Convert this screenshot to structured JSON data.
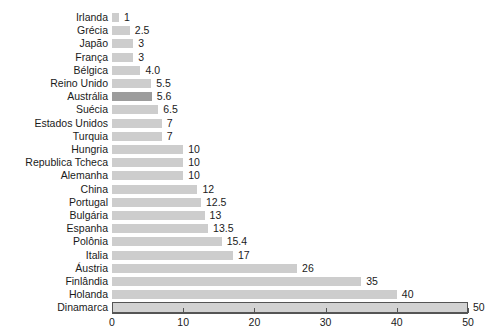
{
  "chart_data": {
    "type": "bar",
    "orientation": "horizontal",
    "title": "",
    "subtitle": "",
    "xlabel": "",
    "ylabel": "",
    "xlim": [
      0,
      50
    ],
    "grid": false,
    "legend": null,
    "xticks": [
      "0",
      "10",
      "20",
      "30",
      "40",
      "50"
    ],
    "xtick_values": [
      0,
      10,
      20,
      30,
      40,
      50
    ],
    "categories": [
      "Irlanda",
      "Grécia",
      "Japão",
      "França",
      "Bélgica",
      "Reino Unido",
      "Austrália",
      "Suécia",
      "Estados Unidos",
      "Turquia",
      "Hungria",
      "Republica Tcheca",
      "Alemanha",
      "China",
      "Portugal",
      "Bulgária",
      "Espanha",
      "Polônia",
      "Italia",
      "Áustria",
      "Finlândia",
      "Holanda",
      "Dinamarca"
    ],
    "values": [
      1,
      2.5,
      3,
      3,
      4.0,
      5.5,
      5.6,
      6.5,
      7,
      7,
      10,
      10,
      10,
      12,
      12.5,
      13,
      13.5,
      15.4,
      17,
      26,
      35,
      40,
      50
    ],
    "value_labels": [
      "1",
      "2.5",
      "3",
      "3",
      "4.0",
      "5.5",
      "5.6",
      "6.5",
      "7",
      "7",
      "10",
      "10",
      "10",
      "12",
      "12.5",
      "13",
      "13.5",
      "15.4",
      "17",
      "26",
      "35",
      "40",
      "50"
    ],
    "highlight_index": 6,
    "colors": {
      "bar": "#cdcdcd",
      "bar_highlight": "#9c9c9c",
      "axis": "#555555",
      "text": "#1a1a1a",
      "background": "#ffffff"
    }
  }
}
